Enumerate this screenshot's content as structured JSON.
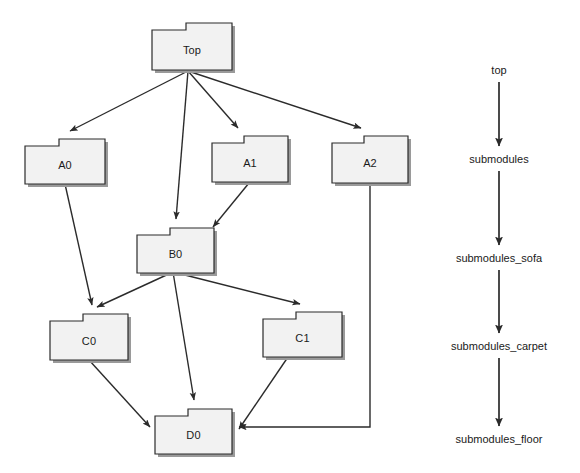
{
  "diagram": {
    "style": {
      "node_fill": "#f2f2f2",
      "node_stroke": "#2b2b2b",
      "node_shadow": "#9a9a9a",
      "edge_color": "#2b2b2b",
      "background": "#ffffff"
    },
    "packages": [
      {
        "id": "top",
        "label": "Top",
        "x": 152,
        "y": 23,
        "w": 80,
        "h": 47,
        "tab_w": 34,
        "tab_h": 7
      },
      {
        "id": "a0",
        "label": "A0",
        "x": 25,
        "y": 139,
        "w": 80,
        "h": 45,
        "tab_w": 34,
        "tab_h": 7
      },
      {
        "id": "a1",
        "label": "A1",
        "x": 212,
        "y": 136,
        "w": 76,
        "h": 46,
        "tab_w": 32,
        "tab_h": 7
      },
      {
        "id": "a2",
        "label": "A2",
        "x": 332,
        "y": 136,
        "w": 76,
        "h": 47,
        "tab_w": 32,
        "tab_h": 7
      },
      {
        "id": "b0",
        "label": "B0",
        "x": 137,
        "y": 228,
        "w": 77,
        "h": 45,
        "tab_w": 33,
        "tab_h": 7
      },
      {
        "id": "c0",
        "label": "C0",
        "x": 50,
        "y": 314,
        "w": 78,
        "h": 46,
        "tab_w": 33,
        "tab_h": 7
      },
      {
        "id": "c1",
        "label": "C1",
        "x": 263,
        "y": 312,
        "w": 79,
        "h": 45,
        "tab_w": 33,
        "tab_h": 7
      },
      {
        "id": "d0",
        "label": "D0",
        "x": 155,
        "y": 409,
        "w": 77,
        "h": 45,
        "tab_w": 33,
        "tab_h": 7
      }
    ],
    "edges": [
      {
        "from": "top",
        "to": "a0"
      },
      {
        "from": "top",
        "to": "b0"
      },
      {
        "from": "top",
        "to": "a1"
      },
      {
        "from": "top",
        "to": "a2"
      },
      {
        "from": "a0",
        "to": "c0"
      },
      {
        "from": "a1",
        "to": "b0"
      },
      {
        "from": "a2",
        "to": "d0"
      },
      {
        "from": "b0",
        "to": "c0"
      },
      {
        "from": "b0",
        "to": "d0"
      },
      {
        "from": "b0",
        "to": "c1"
      },
      {
        "from": "c0",
        "to": "d0"
      },
      {
        "from": "c1",
        "to": "d0"
      }
    ]
  },
  "flow": {
    "arrow_x": 499,
    "steps": [
      {
        "id": "flow-top",
        "label": "top",
        "y": 71
      },
      {
        "id": "flow-submodules",
        "label": "submodules",
        "y": 160
      },
      {
        "id": "flow-submodules-sofa",
        "label": "submodules_sofa",
        "y": 259
      },
      {
        "id": "flow-submodules-carpet",
        "label": "submodules_carpet",
        "y": 347
      },
      {
        "id": "flow-submodules-floor",
        "label": "submodules_floor",
        "y": 440
      }
    ]
  }
}
